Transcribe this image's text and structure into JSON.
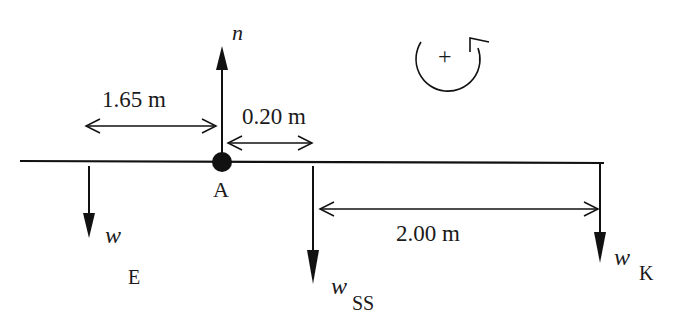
{
  "diagram": {
    "type": "free-body diagram (beam with pivot)",
    "pivot": {
      "label": "A"
    },
    "forces": [
      {
        "id": "n",
        "label": "n",
        "direction": "up",
        "at": "A"
      },
      {
        "id": "wE",
        "label": "w",
        "subscript": "E",
        "direction": "down"
      },
      {
        "id": "wSS",
        "label": "w",
        "subscript": "SS",
        "direction": "down"
      },
      {
        "id": "wK",
        "label": "w",
        "subscript": "K",
        "direction": "down"
      }
    ],
    "dimensions": [
      {
        "id": "d1",
        "label": "1.65 m",
        "between": [
          "wE",
          "A"
        ]
      },
      {
        "id": "d2",
        "label": "0.20 m",
        "between": [
          "A",
          "wSS"
        ]
      },
      {
        "id": "d3",
        "label": "2.00 m",
        "between": [
          "wSS",
          "wK"
        ]
      }
    ],
    "sign_convention": {
      "symbol": "+",
      "direction": "counterclockwise"
    }
  }
}
